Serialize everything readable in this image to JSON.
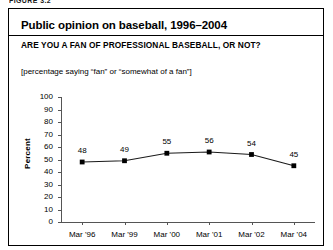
{
  "page": {
    "running_header": "FIGURE 3.2"
  },
  "figure": {
    "title": "Public opinion on baseball, 1996–2004",
    "question": "ARE YOU A FAN OF PROFESSIONAL BASEBALL, OR NOT?",
    "note": "[percentage saying “fan” or “somewhat of a fan”]"
  },
  "chart_data": {
    "type": "line",
    "title": "Public opinion on baseball, 1996–2004",
    "subtitle": "ARE YOU A FAN OF PROFESSIONAL BASEBALL, OR NOT?",
    "annotation": "[percentage saying “fan” or “somewhat of a fan”]",
    "categories": [
      "Mar '96",
      "Mar '99",
      "Mar '00",
      "Mar '01",
      "Mar '02",
      "Mar '04"
    ],
    "values": [
      48,
      49,
      55,
      56,
      54,
      45
    ],
    "point_labels": [
      "48",
      "49",
      "55",
      "56",
      "54",
      "45"
    ],
    "xlabel": "",
    "ylabel": "Percent",
    "ylim": [
      0,
      100
    ],
    "ytick_labels": [
      "100",
      "90",
      "80",
      "70",
      "60",
      "50",
      "40",
      "30",
      "20",
      "10",
      "0"
    ],
    "ytick_values": [
      100,
      90,
      80,
      70,
      60,
      50,
      40,
      30,
      20,
      10,
      0
    ],
    "grid": false,
    "legend": "none",
    "line_color": "#1a1a1a",
    "marker_color": "#000000",
    "marker_shape": "square"
  }
}
